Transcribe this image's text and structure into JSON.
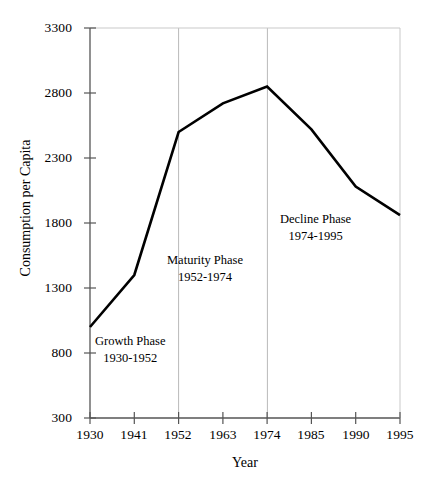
{
  "chart_data": {
    "type": "line",
    "title": "",
    "xlabel": "Year",
    "ylabel": "Consumption per Capita",
    "x": [
      1930,
      1941,
      1952,
      1963,
      1974,
      1985,
      1990,
      1995
    ],
    "categories": [
      "1930",
      "1941",
      "1952",
      "1963",
      "1974",
      "1985",
      "1990",
      "1995"
    ],
    "values": [
      1000,
      1400,
      2500,
      2720,
      2850,
      2520,
      2080,
      1860
    ],
    "series": [
      {
        "name": "Consumption per Capita",
        "values": [
          1000,
          1400,
          2500,
          2720,
          2850,
          2520,
          2080,
          1860
        ]
      }
    ],
    "ylim": [
      300,
      3300
    ],
    "yticks": [
      300,
      800,
      1300,
      1800,
      2300,
      2800,
      3300
    ],
    "ytick_labels": [
      "300",
      "800",
      "1300",
      "1800",
      "2300",
      "2800",
      "3300"
    ],
    "xtick_labels": [
      "1930",
      "1941",
      "1952",
      "1963",
      "1974",
      "1985",
      "1990",
      "1995"
    ],
    "grid": false,
    "vertical_gridlines_at": [
      "1952",
      "1974"
    ],
    "legend": "none",
    "line_color": "#000000",
    "gridline_color": "#b9b9b9",
    "axis_color": "#4d4d4d",
    "annotations": [
      {
        "id": "growth",
        "title": "Growth Phase",
        "range": "1930-1952"
      },
      {
        "id": "maturity",
        "title": "Maturity Phase",
        "range": "1952-1974"
      },
      {
        "id": "decline",
        "title": "Decline Phase",
        "range": "1974-1995"
      }
    ]
  }
}
